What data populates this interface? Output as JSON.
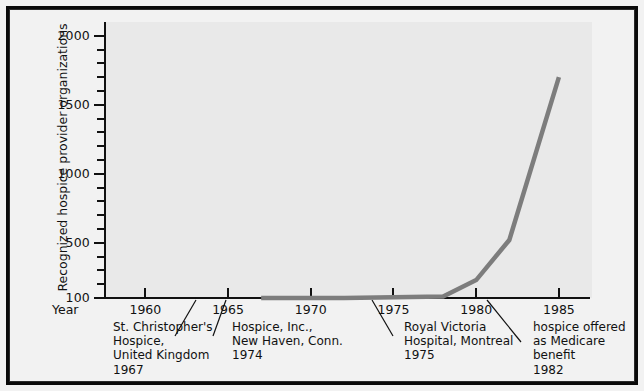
{
  "chart_data": {
    "type": "line",
    "title": "",
    "xlabel": "Year",
    "ylabel": "Recognized hospice provider organizations",
    "xlim": [
      1957.5,
      1987
    ],
    "ylim": [
      100,
      2100
    ],
    "grid": false,
    "legend": null,
    "x": [
      1967,
      1972,
      1975,
      1978,
      1980,
      1982,
      1985
    ],
    "values": [
      100,
      100,
      105,
      110,
      230,
      520,
      1700
    ],
    "series": [
      {
        "name": "Recognized hospice provider organizations",
        "color": "#7d7d7d",
        "x": [
          1967,
          1972,
          1975,
          1978,
          1980,
          1982,
          1985
        ],
        "values": [
          100,
          100,
          105,
          110,
          230,
          520,
          1700
        ]
      }
    ],
    "y_ticks": [
      {
        "value": 2000,
        "label": "2000",
        "major": true
      },
      {
        "value": 1900,
        "label": "",
        "major": false
      },
      {
        "value": 1800,
        "label": "",
        "major": false
      },
      {
        "value": 1700,
        "label": "",
        "major": false
      },
      {
        "value": 1600,
        "label": "",
        "major": false
      },
      {
        "value": 1500,
        "label": "1500",
        "major": true
      },
      {
        "value": 1400,
        "label": "",
        "major": false
      },
      {
        "value": 1300,
        "label": "",
        "major": false
      },
      {
        "value": 1200,
        "label": "",
        "major": false
      },
      {
        "value": 1100,
        "label": "",
        "major": false
      },
      {
        "value": 1000,
        "label": "1000",
        "major": true
      },
      {
        "value": 900,
        "label": "",
        "major": false
      },
      {
        "value": 800,
        "label": "",
        "major": false
      },
      {
        "value": 700,
        "label": "",
        "major": false
      },
      {
        "value": 600,
        "label": "",
        "major": false
      },
      {
        "value": 500,
        "label": "500",
        "major": true
      },
      {
        "value": 400,
        "label": "",
        "major": false
      },
      {
        "value": 300,
        "label": "",
        "major": false
      },
      {
        "value": 200,
        "label": "",
        "major": false
      },
      {
        "value": 100,
        "label": "100",
        "major": true
      }
    ],
    "x_ticks": [
      {
        "value": 1960,
        "label": "1960"
      },
      {
        "value": 1965,
        "label": "1965"
      },
      {
        "value": 1970,
        "label": "1970"
      },
      {
        "value": 1975,
        "label": "1975"
      },
      {
        "value": 1980,
        "label": "1980"
      },
      {
        "value": 1985,
        "label": "1985"
      }
    ],
    "annotations": [
      {
        "id": "st-christophers",
        "text": "St. Christopher's\nHospice,\nUnited Kingdom\n1967",
        "year": 1967,
        "left": 113,
        "top": 320
      },
      {
        "id": "hospice-inc",
        "text": "Hospice, Inc.,\nNew Haven, Conn.\n1974",
        "year": 1974,
        "left": 232,
        "top": 320
      },
      {
        "id": "royal-victoria",
        "text": "Royal Victoria\nHospital, Montreal\n1975",
        "year": 1975,
        "left": 404,
        "top": 320
      },
      {
        "id": "medicare-benefit",
        "text": "hospice offered\nas Medicare\nbenefit\n1982",
        "year": 1982,
        "left": 533,
        "top": 320
      }
    ],
    "leader_lines": [
      {
        "id": "leader-st-christophers",
        "x1": 196,
        "y1": 300,
        "x2": 175,
        "y2": 336
      },
      {
        "id": "leader-hospice-inc",
        "x1": 226,
        "y1": 300,
        "x2": 213,
        "y2": 336
      },
      {
        "id": "leader-royal-victoria",
        "x1": 372,
        "y1": 300,
        "x2": 393,
        "y2": 336
      },
      {
        "id": "leader-medicare",
        "x1": 487,
        "y1": 300,
        "x2": 521,
        "y2": 342
      }
    ]
  },
  "colors": {
    "line": "#7d7d7d",
    "axis": "#111111",
    "plot_bg": "#e9e9e9",
    "figure_bg": "#f2f2f2",
    "frame": "#0a0a0a",
    "text": "#111111"
  }
}
